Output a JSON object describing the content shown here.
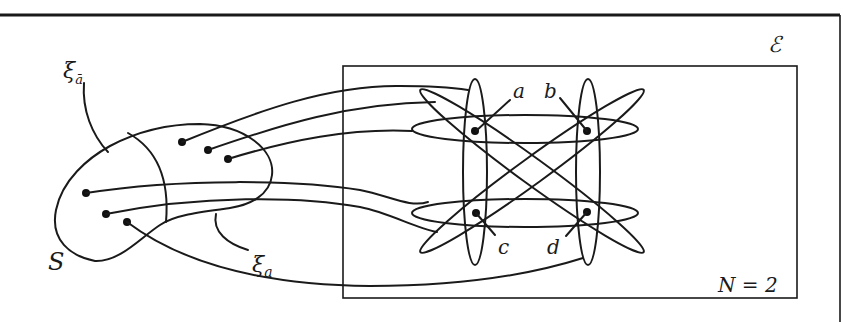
{
  "diagram": {
    "type": "set-mapping diagram",
    "left_set": {
      "label": "S",
      "regions": [
        {
          "label": "ξ",
          "subscript": "ā",
          "description": "left region of S"
        },
        {
          "label": "ξ",
          "subscript": "a",
          "description": "right region of S"
        }
      ],
      "point_count": 6
    },
    "environment": {
      "label": "ℰ",
      "box_label": "N = 2",
      "vertices": [
        {
          "label": "a"
        },
        {
          "label": "b"
        },
        {
          "label": "c"
        },
        {
          "label": "d"
        }
      ],
      "ellipse_count": 6
    },
    "connections": 6
  },
  "labels": {
    "xi": "ξ",
    "xi_sub_abar": "ā",
    "xi_sub_a": "a",
    "S": "S",
    "E": "ℰ",
    "N": "N = 2",
    "a": "a",
    "b": "b",
    "c": "c",
    "d": "d"
  }
}
